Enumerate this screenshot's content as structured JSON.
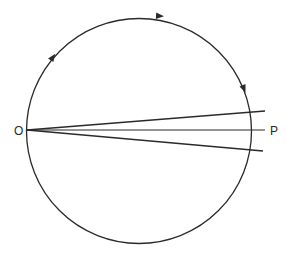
{
  "diagram": {
    "type": "circle-with-rays",
    "labels": {
      "origin": "O",
      "target": "P"
    },
    "path": {
      "shape": "circle",
      "direction": "clockwise",
      "arrow_count": 3
    },
    "rays": {
      "count": 3,
      "names": [
        "upper-ray",
        "center-ray",
        "lower-ray"
      ]
    },
    "colors": {
      "line": "#2a2a2a",
      "background": "#ffffff"
    }
  }
}
